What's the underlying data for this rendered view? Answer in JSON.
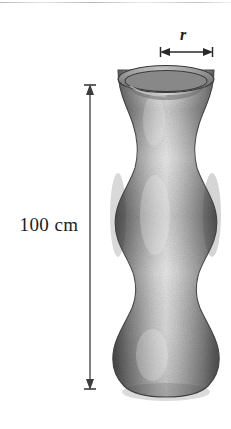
{
  "figure": {
    "kind": "geometry-diagram",
    "background_color": "#ffffff"
  },
  "labels": {
    "height_label": "100 cm",
    "radius_label": "r"
  },
  "dimensions": {
    "height_measure": {
      "name": "vertical-height-dimension",
      "value_text": "100 cm",
      "orientation": "vertical",
      "line_x": 90,
      "top_y": 85,
      "bottom_y": 389,
      "color": "#3c3c3c"
    },
    "radius_measure": {
      "name": "top-radius-dimension",
      "value_text": "r",
      "orientation": "horizontal",
      "line_y": 52,
      "left_x": 161,
      "right_x": 212,
      "color": "#2a2a2a"
    }
  },
  "vase": {
    "name": "vase-illustration",
    "style": "stippled-grayscale-shading",
    "center_x": 166,
    "top_y": 66,
    "bottom_y": 396,
    "rim_outer_half_width": 48,
    "rim_inner_half_width": 41,
    "rim_ellipse_ry": 13,
    "profile_half_widths": [
      {
        "y": 66,
        "r": 48
      },
      {
        "y": 95,
        "r": 45
      },
      {
        "y": 115,
        "r": 38
      },
      {
        "y": 135,
        "r": 31
      },
      {
        "y": 152,
        "r": 28
      },
      {
        "y": 168,
        "r": 31
      },
      {
        "y": 188,
        "r": 42
      },
      {
        "y": 210,
        "r": 52
      },
      {
        "y": 232,
        "r": 50
      },
      {
        "y": 255,
        "r": 42
      },
      {
        "y": 275,
        "r": 33
      },
      {
        "y": 292,
        "r": 30
      },
      {
        "y": 310,
        "r": 34
      },
      {
        "y": 332,
        "r": 45
      },
      {
        "y": 355,
        "r": 53
      },
      {
        "y": 375,
        "r": 51
      },
      {
        "y": 390,
        "r": 41
      },
      {
        "y": 396,
        "r": 30
      }
    ],
    "colors": {
      "edge_dark": "#4a4a4a",
      "mid_gray": "#8e8e8e",
      "highlight": "#e8e8e8",
      "rim_line": "#3a3a3a",
      "interior_dark": "#6f6f6f"
    }
  }
}
